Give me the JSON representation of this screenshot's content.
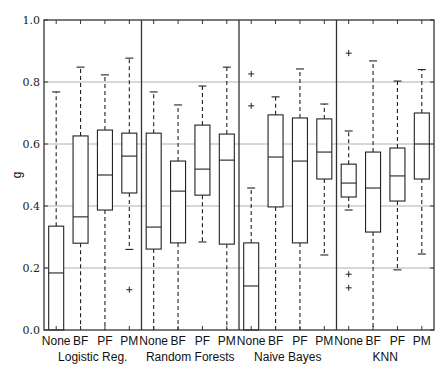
{
  "chart_data": {
    "type": "boxplot",
    "title": "",
    "xlabel": "",
    "ylabel": "g",
    "ylim": [
      0.0,
      1.0
    ],
    "yticks": [
      "0.0",
      "0.2",
      "0.4",
      "0.6",
      "0.8",
      "1.0"
    ],
    "grid": "horizontal",
    "legend": "none",
    "categories": [
      "None",
      "BF",
      "PF",
      "PM"
    ],
    "groups": [
      {
        "name": "Logistic Reg.",
        "boxes": [
          {
            "label": "None",
            "whisker_low": 0.0,
            "q1": 0.0,
            "median": 0.184,
            "q3": 0.335,
            "whisker_high": 0.768,
            "outliers": []
          },
          {
            "label": "BF",
            "whisker_low": 0.0,
            "q1": 0.28,
            "median": 0.365,
            "q3": 0.626,
            "whisker_high": 0.848,
            "outliers": []
          },
          {
            "label": "PF",
            "whisker_low": 0.0,
            "q1": 0.387,
            "median": 0.5,
            "q3": 0.645,
            "whisker_high": 0.823,
            "outliers": []
          },
          {
            "label": "PM",
            "whisker_low": 0.26,
            "q1": 0.442,
            "median": 0.561,
            "q3": 0.635,
            "whisker_high": 0.877,
            "outliers": [
              0.13
            ]
          }
        ]
      },
      {
        "name": "Random Forests",
        "boxes": [
          {
            "label": "None",
            "whisker_low": 0.0,
            "q1": 0.261,
            "median": 0.332,
            "q3": 0.635,
            "whisker_high": 0.768,
            "outliers": []
          },
          {
            "label": "BF",
            "whisker_low": 0.0,
            "q1": 0.281,
            "median": 0.448,
            "q3": 0.545,
            "whisker_high": 0.726,
            "outliers": []
          },
          {
            "label": "PF",
            "whisker_low": 0.284,
            "q1": 0.435,
            "median": 0.519,
            "q3": 0.661,
            "whisker_high": 0.787,
            "outliers": []
          },
          {
            "label": "PM",
            "whisker_low": 0.0,
            "q1": 0.277,
            "median": 0.548,
            "q3": 0.632,
            "whisker_high": 0.848,
            "outliers": []
          }
        ]
      },
      {
        "name": "Naive Bayes",
        "boxes": [
          {
            "label": "None",
            "whisker_low": 0.0,
            "q1": 0.0,
            "median": 0.142,
            "q3": 0.281,
            "whisker_high": 0.458,
            "outliers": [
              0.826,
              0.723
            ]
          },
          {
            "label": "BF",
            "whisker_low": 0.0,
            "q1": 0.397,
            "median": 0.558,
            "q3": 0.694,
            "whisker_high": 0.752,
            "outliers": []
          },
          {
            "label": "PF",
            "whisker_low": 0.0,
            "q1": 0.281,
            "median": 0.545,
            "q3": 0.684,
            "whisker_high": 0.842,
            "outliers": []
          },
          {
            "label": "PM",
            "whisker_low": 0.242,
            "q1": 0.487,
            "median": 0.574,
            "q3": 0.681,
            "whisker_high": 0.729,
            "outliers": []
          }
        ]
      },
      {
        "name": "KNN",
        "boxes": [
          {
            "label": "None",
            "whisker_low": 0.387,
            "q1": 0.429,
            "median": 0.474,
            "q3": 0.535,
            "whisker_high": 0.642,
            "outliers": [
              0.893,
              0.18,
              0.136
            ]
          },
          {
            "label": "BF",
            "whisker_low": 0.0,
            "q1": 0.316,
            "median": 0.458,
            "q3": 0.574,
            "whisker_high": 0.868,
            "outliers": []
          },
          {
            "label": "PF",
            "whisker_low": 0.194,
            "q1": 0.416,
            "median": 0.497,
            "q3": 0.587,
            "whisker_high": 0.803,
            "outliers": []
          },
          {
            "label": "PM",
            "whisker_low": 0.245,
            "q1": 0.487,
            "median": 0.6,
            "q3": 0.7,
            "whisker_high": 0.84,
            "outliers": []
          }
        ]
      }
    ]
  },
  "colors": {
    "axis": "#333333",
    "grid": "#b0b0b0",
    "box": "#222222",
    "background": "#ffffff"
  }
}
